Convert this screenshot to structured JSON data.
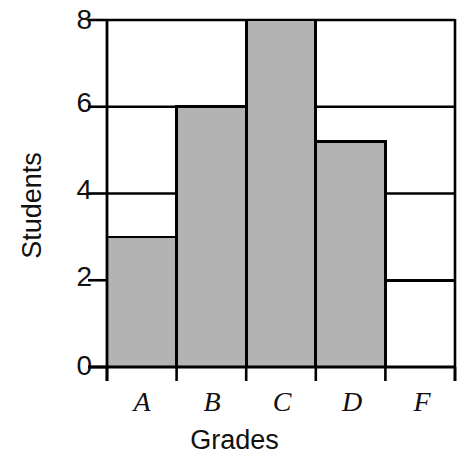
{
  "chart_data": {
    "type": "bar",
    "title": "",
    "subtitle": "",
    "xlabel": "Grades",
    "ylabel": "Students",
    "categories": [
      "A",
      "B",
      "C",
      "D",
      "F"
    ],
    "values": [
      3,
      6,
      8,
      5.2,
      2
    ],
    "series": [
      {
        "name": "Students",
        "values": [
          3,
          6,
          8,
          5.2,
          2
        ]
      }
    ],
    "ylim": [
      0,
      8
    ],
    "yticks": [
      0,
      2,
      4,
      6,
      8
    ],
    "ytick_labels": [
      "0",
      "2",
      "4",
      "6",
      "8"
    ],
    "xtick_labels": [
      "A",
      "B",
      "C",
      "D",
      "F"
    ],
    "grid": true,
    "grid_orientation": "horizontal",
    "legend": null,
    "legend_position": "none",
    "bar_fill_color": "#b3b3b3",
    "bar_edge_color": "#000000",
    "axis_color": "#000000",
    "background_color": "#ffffff",
    "annotations": []
  },
  "axes": {
    "y_title": "Students",
    "x_title": "Grades",
    "y_tick_values": [
      "8",
      "6",
      "4",
      "2",
      "0"
    ],
    "x_tick_values": [
      "A",
      "B",
      "C",
      "D",
      "F"
    ]
  }
}
